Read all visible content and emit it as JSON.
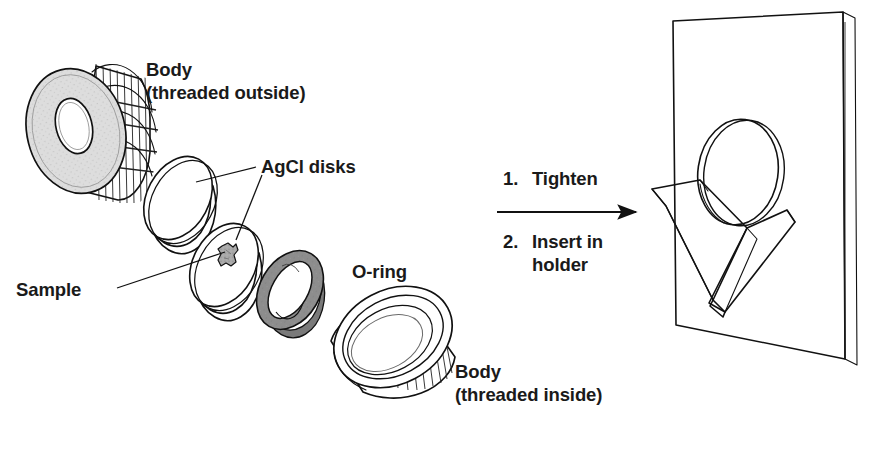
{
  "figure": {
    "background_color": "#ffffff",
    "ink_color": "#111111",
    "width": 876,
    "height": 454
  },
  "labels": {
    "body_outside_line1": "Body",
    "body_outside_line2": "(threaded outside)",
    "agcl_disks": "AgCl disks",
    "sample": "Sample",
    "oring": "O-ring",
    "body_inside_line1": "Body",
    "body_inside_line2": "(threaded inside)"
  },
  "steps": [
    {
      "number": "1.",
      "text": "Tighten"
    },
    {
      "number": "2.",
      "text": "Insert in",
      "text_line2": "holder"
    }
  ],
  "parts": [
    {
      "id": "body-threaded-outside",
      "name": "Body (threaded outside)",
      "description": "Knurled cylindrical nut, gray annular face with central bore",
      "face_color": "#d8d8d8",
      "thread_color": "#ffffff"
    },
    {
      "id": "agcl-disk-upper",
      "name": "AgCl disk (upper)",
      "description": "White transparent disk",
      "face_color": "#ffffff"
    },
    {
      "id": "agcl-disk-lower",
      "name": "AgCl disk (lower)",
      "description": "White transparent disk carrying the sample",
      "face_color": "#ffffff"
    },
    {
      "id": "sample",
      "name": "Sample",
      "description": "Small irregular gray flake at the centre of the lower disk",
      "face_color": "#9a9a9a"
    },
    {
      "id": "o-ring",
      "name": "O-ring",
      "description": "Dark gray elastomer annulus",
      "face_color": "#8d8d8d"
    },
    {
      "id": "body-threaded-inside",
      "name": "Body (threaded inside)",
      "description": "Knurled ring, threaded on the inner wall",
      "face_color": "#e8e8e8",
      "thread_color": "#ffffff"
    },
    {
      "id": "holder-plate",
      "name": "Holder plate",
      "description": "Flat rectangular plate shown in perspective",
      "face_color": "#ffffff"
    },
    {
      "id": "v-bracket",
      "name": "V-shaped bracket",
      "description": "V mount on the plate that cradles the assembled cell",
      "face_color": "#ffffff"
    },
    {
      "id": "assembled-cell",
      "name": "Assembled cell in holder",
      "description": "Tilted ring seated in the V bracket",
      "face_color": "#ffffff"
    }
  ],
  "arrow": {
    "name": "process-arrow",
    "direction": "left-to-right"
  }
}
